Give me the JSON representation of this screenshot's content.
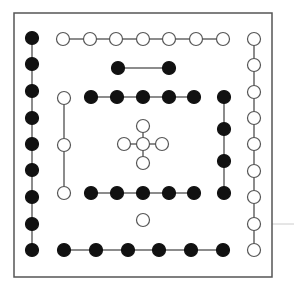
{
  "game": {
    "type": "connect-dots-puzzle",
    "frame": {
      "x": 14,
      "y": 13,
      "width": 258,
      "height": 264,
      "stroke": "#555555"
    },
    "guide_line": {
      "x1": 272,
      "y1": 224,
      "x2": 294,
      "y2": 224,
      "stroke": "#cccccc"
    },
    "colors": {
      "black": "#111111",
      "white": "#ffffff",
      "outline": "#555555",
      "edge": "#666666"
    },
    "node_radius": 6.5,
    "nodes": [
      {
        "id": "L1",
        "x": 32,
        "y": 38,
        "color": "black"
      },
      {
        "id": "L2",
        "x": 32,
        "y": 64,
        "color": "black"
      },
      {
        "id": "L3",
        "x": 32,
        "y": 91,
        "color": "black"
      },
      {
        "id": "L4",
        "x": 32,
        "y": 118,
        "color": "black"
      },
      {
        "id": "L5",
        "x": 32,
        "y": 144,
        "color": "black"
      },
      {
        "id": "L6",
        "x": 32,
        "y": 170,
        "color": "black"
      },
      {
        "id": "L7",
        "x": 32,
        "y": 197,
        "color": "black"
      },
      {
        "id": "L8",
        "x": 32,
        "y": 224,
        "color": "black"
      },
      {
        "id": "L9",
        "x": 32,
        "y": 250,
        "color": "black"
      },
      {
        "id": "T1",
        "x": 63,
        "y": 39,
        "color": "white"
      },
      {
        "id": "T2",
        "x": 90,
        "y": 39,
        "color": "white"
      },
      {
        "id": "T3",
        "x": 116,
        "y": 39,
        "color": "white"
      },
      {
        "id": "T4",
        "x": 143,
        "y": 39,
        "color": "white"
      },
      {
        "id": "T5",
        "x": 169,
        "y": 39,
        "color": "white"
      },
      {
        "id": "T6",
        "x": 196,
        "y": 39,
        "color": "white"
      },
      {
        "id": "T7",
        "x": 223,
        "y": 39,
        "color": "white"
      },
      {
        "id": "R1",
        "x": 254,
        "y": 39,
        "color": "white"
      },
      {
        "id": "R2",
        "x": 254,
        "y": 65,
        "color": "white"
      },
      {
        "id": "R3",
        "x": 254,
        "y": 92,
        "color": "white"
      },
      {
        "id": "R4",
        "x": 254,
        "y": 118,
        "color": "white"
      },
      {
        "id": "R5",
        "x": 254,
        "y": 144,
        "color": "white"
      },
      {
        "id": "R6",
        "x": 254,
        "y": 171,
        "color": "white"
      },
      {
        "id": "R7",
        "x": 254,
        "y": 197,
        "color": "white"
      },
      {
        "id": "R8",
        "x": 254,
        "y": 224,
        "color": "white"
      },
      {
        "id": "R9",
        "x": 254,
        "y": 250,
        "color": "white"
      },
      {
        "id": "S1",
        "x": 118,
        "y": 68,
        "color": "black"
      },
      {
        "id": "S2",
        "x": 169,
        "y": 68,
        "color": "black"
      },
      {
        "id": "A1",
        "x": 91,
        "y": 97,
        "color": "black"
      },
      {
        "id": "A2",
        "x": 117,
        "y": 97,
        "color": "black"
      },
      {
        "id": "A3",
        "x": 143,
        "y": 97,
        "color": "black"
      },
      {
        "id": "A4",
        "x": 169,
        "y": 97,
        "color": "black"
      },
      {
        "id": "A5",
        "x": 194,
        "y": 97,
        "color": "black"
      },
      {
        "id": "V1",
        "x": 64,
        "y": 98,
        "color": "white"
      },
      {
        "id": "V2",
        "x": 64,
        "y": 145,
        "color": "white"
      },
      {
        "id": "V3",
        "x": 64,
        "y": 193,
        "color": "white"
      },
      {
        "id": "C0",
        "x": 143,
        "y": 144,
        "color": "white"
      },
      {
        "id": "CT",
        "x": 143,
        "y": 126,
        "color": "white"
      },
      {
        "id": "CL",
        "x": 124,
        "y": 144,
        "color": "white"
      },
      {
        "id": "CR",
        "x": 162,
        "y": 144,
        "color": "white"
      },
      {
        "id": "CB",
        "x": 143,
        "y": 163,
        "color": "white"
      },
      {
        "id": "K1",
        "x": 224,
        "y": 97,
        "color": "black"
      },
      {
        "id": "K2",
        "x": 224,
        "y": 129,
        "color": "black"
      },
      {
        "id": "K3",
        "x": 224,
        "y": 161,
        "color": "black"
      },
      {
        "id": "K4",
        "x": 224,
        "y": 193,
        "color": "black"
      },
      {
        "id": "B1",
        "x": 91,
        "y": 193,
        "color": "black"
      },
      {
        "id": "B2",
        "x": 117,
        "y": 193,
        "color": "black"
      },
      {
        "id": "B3",
        "x": 143,
        "y": 193,
        "color": "black"
      },
      {
        "id": "B4",
        "x": 169,
        "y": 193,
        "color": "black"
      },
      {
        "id": "B5",
        "x": 194,
        "y": 193,
        "color": "black"
      },
      {
        "id": "W1",
        "x": 143,
        "y": 220,
        "color": "white"
      },
      {
        "id": "D1",
        "x": 64,
        "y": 250,
        "color": "black"
      },
      {
        "id": "D2",
        "x": 96,
        "y": 250,
        "color": "black"
      },
      {
        "id": "D3",
        "x": 128,
        "y": 250,
        "color": "black"
      },
      {
        "id": "D4",
        "x": 159,
        "y": 250,
        "color": "black"
      },
      {
        "id": "D5",
        "x": 191,
        "y": 250,
        "color": "black"
      },
      {
        "id": "D6",
        "x": 223,
        "y": 250,
        "color": "black"
      }
    ],
    "edges": [
      [
        "L1",
        "L9"
      ],
      [
        "T1",
        "T7"
      ],
      [
        "R1",
        "R9"
      ],
      [
        "S1",
        "S2"
      ],
      [
        "A1",
        "A5"
      ],
      [
        "V1",
        "V3"
      ],
      [
        "CL",
        "CR"
      ],
      [
        "CT",
        "CB"
      ],
      [
        "K1",
        "K4"
      ],
      [
        "B1",
        "B5"
      ],
      [
        "D1",
        "D6"
      ]
    ]
  }
}
